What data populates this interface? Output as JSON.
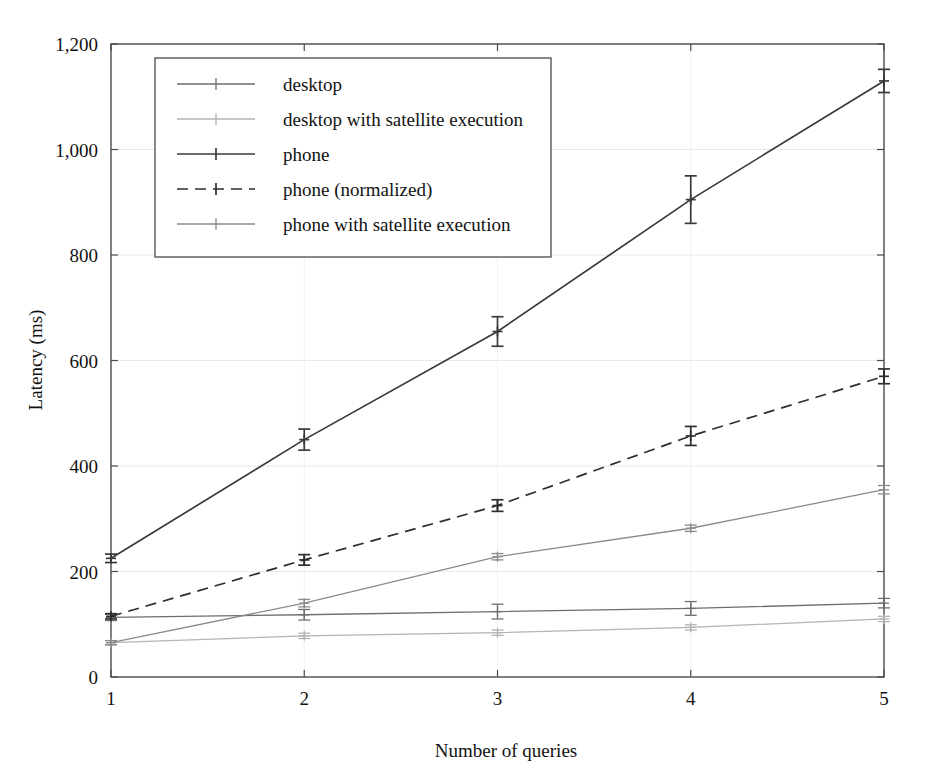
{
  "chart_data": {
    "type": "line",
    "title": "",
    "xlabel": "Number of queries",
    "ylabel": "Latency (ms)",
    "x": [
      1,
      2,
      3,
      4,
      5
    ],
    "xtick_labels": [
      "1",
      "2",
      "3",
      "4",
      "5"
    ],
    "ytick_labels": [
      "0",
      "200",
      "400",
      "600",
      "800",
      "1,000",
      "1,200"
    ],
    "yticks": [
      0,
      200,
      400,
      600,
      800,
      1000,
      1200
    ],
    "xlim": [
      1,
      5
    ],
    "ylim": [
      0,
      1200
    ],
    "grid": true,
    "legend_position": "upper-left-inside",
    "series": [
      {
        "name": "desktop",
        "color": "#6e6e6e",
        "dash": "none",
        "values": [
          113,
          118,
          124,
          130,
          140
        ],
        "errors": [
          6,
          10,
          14,
          13,
          9
        ]
      },
      {
        "name": "desktop with satellite execution",
        "color": "#b4b4b4",
        "dash": "none",
        "values": [
          65,
          78,
          84,
          94,
          110
        ],
        "errors": [
          4,
          5,
          5,
          5,
          5
        ]
      },
      {
        "name": "phone",
        "color": "#3a3a3a",
        "dash": "none",
        "values": [
          225,
          450,
          655,
          905,
          1130
        ],
        "errors": [
          8,
          20,
          28,
          45,
          22
        ]
      },
      {
        "name": "phone (normalized)",
        "color": "#2e2e2e",
        "dash": "dashed",
        "values": [
          115,
          222,
          325,
          457,
          570
        ],
        "errors": [
          5,
          10,
          11,
          18,
          14
        ]
      },
      {
        "name": "phone with satellite execution",
        "color": "#8a8a8a",
        "dash": "none",
        "values": [
          65,
          140,
          228,
          282,
          355
        ],
        "errors": [
          4,
          7,
          6,
          6,
          8
        ]
      }
    ]
  },
  "legend": {
    "entries": [
      "desktop",
      "desktop with satellite execution",
      "phone",
      "phone (normalized)",
      "phone with satellite execution"
    ]
  },
  "axes": {
    "x_title": "Number of queries",
    "y_title": "Latency (ms)"
  }
}
